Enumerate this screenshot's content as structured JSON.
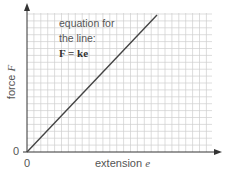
{
  "chart_data": {
    "type": "line",
    "title": "",
    "xlabel": "extension e",
    "ylabel": "force F",
    "x_tick_labels": [
      "0"
    ],
    "y_tick_labels": [
      "0"
    ],
    "grid": true,
    "legend": null,
    "series": [
      {
        "name": "F = ke",
        "x": [
          0,
          1
        ],
        "y": [
          0,
          1
        ],
        "note": "straight line through origin (proportional)"
      }
    ],
    "annotations": [
      "equation for",
      "the line:",
      "F = ke"
    ]
  },
  "labels": {
    "x_axis": "extension ",
    "x_var": "e",
    "y_axis": "force ",
    "y_var": "F",
    "x_origin": "0",
    "y_origin": "0",
    "ann_line1": "equation for",
    "ann_line2": "the line:",
    "ann_eq": "F = ke"
  },
  "colors": {
    "grid": "#c8c8c8",
    "axis": "#333333",
    "line": "#444444",
    "text": "#555555"
  }
}
